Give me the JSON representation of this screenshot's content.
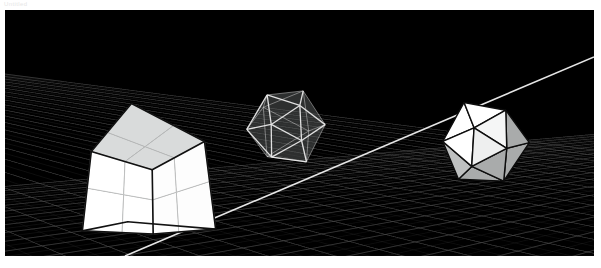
{
  "window": {
    "status_text": "Untitled"
  },
  "viewport": {
    "name": "3d-viewport",
    "background_color": "#000000",
    "bounds": {
      "x": 5,
      "y": 10,
      "width": 589,
      "height": 246
    }
  },
  "scene": {
    "ground": {
      "label": "perspective-grid-floor",
      "floor_color": "#050505",
      "sky_color": "#000000",
      "grid_line_color": "#7a7a7a",
      "grid_line_color_faint": "#3a3a3a",
      "highlight_line_color": "#f2f2f2",
      "horizon_left_y": 20,
      "horizon_right_y": 46,
      "grid_lines_along": 34,
      "grid_lines_across": 30
    },
    "objects": [
      {
        "id": "cube",
        "name": "subdivided-cube",
        "render_mode": "solid",
        "subdivisions": 2,
        "face_color_front": "#ffffff",
        "face_color_side": "#fdfdfd",
        "face_color_top": "#d9dbdb",
        "edge_color": "#111111",
        "inner_line_color": "#b6b8b8",
        "position": {
          "x": 140,
          "y": 175
        }
      },
      {
        "id": "icosahedron-wire",
        "name": "wireframe-icosahedron",
        "render_mode": "wireframe-translucent",
        "face_color": "#6a6c6c",
        "face_opacity": 0.55,
        "edge_color": "#eaeaea",
        "position": {
          "x": 281,
          "y": 117
        }
      },
      {
        "id": "icosahedron-solid",
        "name": "solid-icosahedron",
        "render_mode": "solid-shaded",
        "face_color_lit": "#ffffff",
        "face_color_mid": "#d2d4d4",
        "face_color_shade": "#a9abab",
        "edge_color": "#0d0d0d",
        "position": {
          "x": 479,
          "y": 132
        }
      }
    ]
  }
}
